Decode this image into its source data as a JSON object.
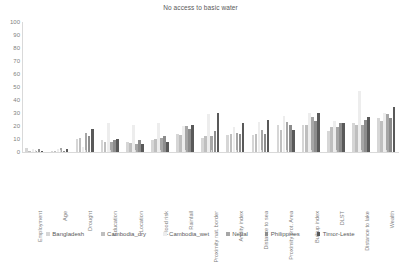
{
  "chart_data": {
    "type": "bar",
    "title": "No access to basic water",
    "xlabel": "",
    "ylabel": "",
    "ylim": [
      0,
      100
    ],
    "yticks": [
      0,
      10,
      20,
      30,
      40,
      50,
      60,
      70,
      80,
      90,
      100
    ],
    "grid": false,
    "legend_position": "bottom",
    "categories": [
      "Employment",
      "Age",
      "Drought",
      "Education",
      "Location",
      "Flood risk",
      "Rainfall",
      "Proximity nat. border",
      "Aridity index",
      "Distance to sea",
      "Proximity prot. Area",
      "Builtup index",
      "DLST",
      "Distance to lake",
      "Wealth"
    ],
    "series": [
      {
        "name": "Bangladesh",
        "color": "#d6d6d6",
        "values": [
          3,
          1,
          10,
          9,
          8,
          9,
          14,
          11,
          13,
          13,
          21,
          21,
          16,
          22,
          26
        ]
      },
      {
        "name": "Cambodia_dry",
        "color": "#bfbfbf",
        "values": [
          1,
          1,
          11,
          8,
          7,
          10,
          13,
          12,
          14,
          14,
          17,
          21,
          19,
          21,
          24
        ]
      },
      {
        "name": "Cambodia_wet",
        "color": "#ededed",
        "values": [
          2,
          2,
          4,
          22,
          21,
          22,
          20,
          29,
          19,
          23,
          28,
          30,
          24,
          47,
          30
        ]
      },
      {
        "name": "Nepal",
        "color": "#a6a6a6",
        "values": [
          1,
          3,
          15,
          8,
          6,
          11,
          20,
          12,
          15,
          17,
          23,
          27,
          19,
          21,
          29
        ]
      },
      {
        "name": "Philippines",
        "color": "#8c8c8c",
        "values": [
          2,
          1,
          12,
          9,
          9,
          12,
          18,
          16,
          14,
          14,
          21,
          24,
          22,
          25,
          26
        ]
      },
      {
        "name": "Timor-Leste",
        "color": "#595959",
        "values": [
          1,
          2,
          18,
          10,
          6,
          8,
          21,
          30,
          22,
          25,
          17,
          30,
          22,
          27,
          35
        ]
      }
    ]
  }
}
